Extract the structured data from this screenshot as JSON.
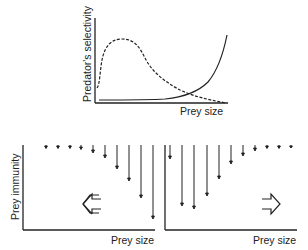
{
  "top_panel": {
    "ylabel": "Predator's selectivity",
    "xlabel": "Prey size",
    "curves": [
      {
        "name": "dashed-hump-curve",
        "style": "dashed",
        "description": "selectivity peaks at small prey size then declines"
      },
      {
        "name": "solid-rising-curve",
        "style": "solid",
        "description": "selectivity rises steeply with large prey size"
      }
    ]
  },
  "bottom_left_panel": {
    "ylabel": "Prey immunity",
    "xlabel": "Prey size",
    "direction_arrow": "left",
    "arrow_lengths": [
      1,
      2,
      2,
      3,
      6,
      11,
      22,
      34,
      51,
      72
    ]
  },
  "bottom_right_panel": {
    "xlabel": "Prey size",
    "direction_arrow": "right",
    "arrow_lengths": [
      12,
      59,
      62,
      49,
      32,
      17,
      9,
      4,
      2,
      1,
      1
    ]
  },
  "colors": {
    "ink": "#222222",
    "background": "#ffffff"
  }
}
